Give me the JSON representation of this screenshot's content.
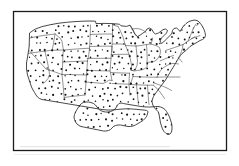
{
  "figure": {
    "kind": "dot-density-map",
    "title": "",
    "caption": "",
    "region": "Contiguous United States",
    "labels_present": false,
    "legend_present": false,
    "colors": {
      "background": "#ffffff",
      "frame_border": "#1c1c1c",
      "coastline": "#2b2b2b",
      "state_border": "#3a3a3a",
      "dot": "#141414"
    },
    "frame": {
      "x": 13,
      "y": 11,
      "width": 214,
      "height": 140,
      "border_width_px": 1.3
    },
    "map_extent": {
      "x": 26,
      "y": 19,
      "width": 188,
      "height": 121
    }
  },
  "chart_data": {
    "type": "map",
    "title": "",
    "xlabel": "",
    "ylabel": "",
    "symbol": "dot",
    "dot_spacing_px": 6.3,
    "dot_radius_px": 0.85,
    "states": [
      {
        "code": "WA",
        "name": "Washington",
        "density": "uniform"
      },
      {
        "code": "OR",
        "name": "Oregon",
        "density": "uniform"
      },
      {
        "code": "CA",
        "name": "California",
        "density": "uniform"
      },
      {
        "code": "NV",
        "name": "Nevada",
        "density": "uniform"
      },
      {
        "code": "ID",
        "name": "Idaho",
        "density": "uniform"
      },
      {
        "code": "MT",
        "name": "Montana",
        "density": "uniform"
      },
      {
        "code": "WY",
        "name": "Wyoming",
        "density": "uniform"
      },
      {
        "code": "UT",
        "name": "Utah",
        "density": "uniform"
      },
      {
        "code": "AZ",
        "name": "Arizona",
        "density": "uniform"
      },
      {
        "code": "CO",
        "name": "Colorado",
        "density": "uniform"
      },
      {
        "code": "NM",
        "name": "New Mexico",
        "density": "uniform"
      },
      {
        "code": "ND",
        "name": "North Dakota",
        "density": "uniform"
      },
      {
        "code": "SD",
        "name": "South Dakota",
        "density": "uniform"
      },
      {
        "code": "NE",
        "name": "Nebraska",
        "density": "uniform"
      },
      {
        "code": "KS",
        "name": "Kansas",
        "density": "uniform"
      },
      {
        "code": "OK",
        "name": "Oklahoma",
        "density": "uniform"
      },
      {
        "code": "TX",
        "name": "Texas",
        "density": "uniform"
      },
      {
        "code": "MN",
        "name": "Minnesota",
        "density": "uniform"
      },
      {
        "code": "IA",
        "name": "Iowa",
        "density": "uniform"
      },
      {
        "code": "MO",
        "name": "Missouri",
        "density": "uniform"
      },
      {
        "code": "AR",
        "name": "Arkansas",
        "density": "uniform"
      },
      {
        "code": "LA",
        "name": "Louisiana",
        "density": "uniform"
      },
      {
        "code": "WI",
        "name": "Wisconsin",
        "density": "uniform"
      },
      {
        "code": "IL",
        "name": "Illinois",
        "density": "uniform"
      },
      {
        "code": "MI",
        "name": "Michigan",
        "density": "uniform"
      },
      {
        "code": "IN",
        "name": "Indiana",
        "density": "uniform"
      },
      {
        "code": "OH",
        "name": "Ohio",
        "density": "uniform"
      },
      {
        "code": "KY",
        "name": "Kentucky",
        "density": "uniform"
      },
      {
        "code": "TN",
        "name": "Tennessee",
        "density": "uniform"
      },
      {
        "code": "MS",
        "name": "Mississippi",
        "density": "uniform"
      },
      {
        "code": "AL",
        "name": "Alabama",
        "density": "uniform"
      },
      {
        "code": "GA",
        "name": "Georgia",
        "density": "uniform"
      },
      {
        "code": "FL",
        "name": "Florida",
        "density": "uniform"
      },
      {
        "code": "SC",
        "name": "South Carolina",
        "density": "uniform"
      },
      {
        "code": "NC",
        "name": "North Carolina",
        "density": "uniform"
      },
      {
        "code": "VA",
        "name": "Virginia",
        "density": "uniform"
      },
      {
        "code": "WV",
        "name": "West Virginia",
        "density": "uniform"
      },
      {
        "code": "MD",
        "name": "Maryland",
        "density": "uniform"
      },
      {
        "code": "DE",
        "name": "Delaware",
        "density": "uniform"
      },
      {
        "code": "PA",
        "name": "Pennsylvania",
        "density": "uniform"
      },
      {
        "code": "NJ",
        "name": "New Jersey",
        "density": "uniform"
      },
      {
        "code": "NY",
        "name": "New York",
        "density": "uniform"
      },
      {
        "code": "CT",
        "name": "Connecticut",
        "density": "uniform"
      },
      {
        "code": "RI",
        "name": "Rhode Island",
        "density": "uniform"
      },
      {
        "code": "MA",
        "name": "Massachusetts",
        "density": "uniform"
      },
      {
        "code": "VT",
        "name": "Vermont",
        "density": "uniform"
      },
      {
        "code": "NH",
        "name": "New Hampshire",
        "density": "uniform"
      },
      {
        "code": "ME",
        "name": "Maine",
        "density": "uniform"
      }
    ]
  }
}
